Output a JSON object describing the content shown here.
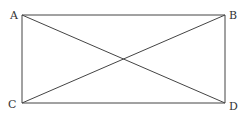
{
  "diagram": {
    "type": "geometry",
    "shape": "rectangle-with-diagonals",
    "stroke_color": "#444444",
    "points": [
      {
        "label": "A",
        "x": 22,
        "y": 15,
        "lx": 10,
        "ly": 19
      },
      {
        "label": "B",
        "x": 225,
        "y": 15,
        "lx": 229,
        "ly": 19
      },
      {
        "label": "C",
        "x": 22,
        "y": 103,
        "lx": 8,
        "ly": 108
      },
      {
        "label": "D",
        "x": 225,
        "y": 103,
        "lx": 229,
        "ly": 110
      }
    ],
    "segments": [
      [
        "A",
        "B"
      ],
      [
        "C",
        "D"
      ],
      [
        "A",
        "C"
      ],
      [
        "B",
        "D"
      ],
      [
        "A",
        "D"
      ],
      [
        "C",
        "B"
      ]
    ]
  }
}
